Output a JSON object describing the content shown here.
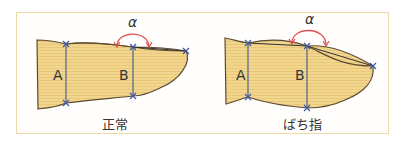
{
  "diagram": {
    "panels": [
      {
        "caption": "正常",
        "labels": {
          "A": "A",
          "B": "B",
          "angle": "α"
        }
      },
      {
        "caption": "ばち指",
        "labels": {
          "A": "A",
          "B": "B",
          "angle": "α"
        }
      }
    ],
    "colors": {
      "finger_fill": "#f2d690",
      "finger_stripe": "#e8c570",
      "outline": "#5a4a30",
      "measure_line": "#5a6a8a",
      "marker": "#3a5aa8",
      "angle_arc": "#e05050",
      "frame_border": "#eed9a8"
    }
  }
}
